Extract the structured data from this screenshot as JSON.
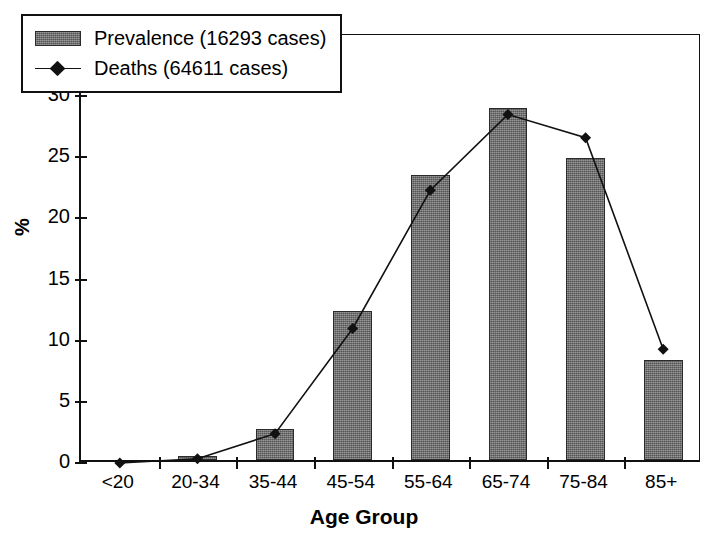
{
  "chart_data": {
    "type": "bar",
    "title": "",
    "xlabel": "Age Group",
    "ylabel": "%",
    "ylim": [
      0,
      35
    ],
    "yticks": [
      0,
      5,
      10,
      15,
      20,
      25,
      30,
      35
    ],
    "ytick_labels": [
      "0",
      "5",
      "10",
      "15",
      "20",
      "25",
      "30",
      "35"
    ],
    "categories": [
      "<20",
      "20-34",
      "35-44",
      "45-54",
      "55-64",
      "65-74",
      "75-84",
      "85+"
    ],
    "grid": false,
    "legend_position": "top-left",
    "series": [
      {
        "name": "Prevalence (16293 cases)",
        "type": "bar",
        "marker": "none",
        "color": "#6e6e6e",
        "values": [
          0.0,
          0.3,
          2.5,
          12.2,
          23.3,
          28.8,
          24.7,
          8.2
        ]
      },
      {
        "name": "Deaths (64611 cases)",
        "type": "line",
        "marker": "diamond",
        "color": "#111111",
        "values": [
          0.0,
          0.35,
          2.4,
          11.0,
          22.3,
          28.5,
          26.6,
          9.3
        ]
      }
    ]
  },
  "axes": {
    "y_title": "%",
    "x_title": "Age Group"
  },
  "legend": {
    "items": [
      {
        "label": "Prevalence (16293 cases)",
        "swatch": "bar-swatch"
      },
      {
        "label": "Deaths (64611 cases)",
        "swatch": "line-marker-swatch"
      }
    ]
  }
}
